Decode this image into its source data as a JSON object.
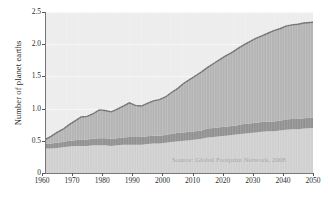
{
  "chart_data": {
    "type": "area",
    "title": "",
    "subtitle": "",
    "xlabel": "",
    "ylabel": "Number of planet earths",
    "xlim": [
      1961,
      2050
    ],
    "ylim": [
      0,
      2.5
    ],
    "grid": true,
    "legend_position": "none",
    "annotations": [
      "Source: Global Footprint Network, 2008"
    ],
    "xticks": [
      "1960",
      "1970",
      "1980",
      "1990",
      "2000",
      "2010",
      "2020",
      "2030",
      "2040",
      "2050"
    ],
    "yticks": [
      "0",
      "0.5",
      "1.0",
      "1.5",
      "2.0",
      "2.5"
    ],
    "stacked": true,
    "x": [
      1961,
      1963,
      1965,
      1967,
      1969,
      1971,
      1973,
      1975,
      1977,
      1979,
      1981,
      1983,
      1985,
      1987,
      1989,
      1991,
      1993,
      1995,
      1997,
      1999,
      2001,
      2003,
      2005,
      2007,
      2009,
      2011,
      2013,
      2015,
      2017,
      2019,
      2021,
      2023,
      2025,
      2027,
      2029,
      2031,
      2033,
      2035,
      2037,
      2039,
      2041,
      2043,
      2045,
      2047,
      2050
    ],
    "series": [
      {
        "name": "Band 1 (bottom, light grey)",
        "color": "#cfcfcf",
        "values": [
          0.38,
          0.38,
          0.39,
          0.4,
          0.41,
          0.42,
          0.42,
          0.42,
          0.43,
          0.43,
          0.43,
          0.42,
          0.43,
          0.44,
          0.44,
          0.44,
          0.44,
          0.45,
          0.46,
          0.46,
          0.47,
          0.48,
          0.49,
          0.5,
          0.51,
          0.52,
          0.53,
          0.55,
          0.56,
          0.57,
          0.58,
          0.59,
          0.6,
          0.61,
          0.62,
          0.63,
          0.64,
          0.65,
          0.65,
          0.66,
          0.67,
          0.68,
          0.68,
          0.69,
          0.7
        ]
      },
      {
        "name": "Band 2 (middle, dark grey)",
        "color": "#8f8f8f",
        "values": [
          0.07,
          0.08,
          0.08,
          0.08,
          0.09,
          0.09,
          0.1,
          0.1,
          0.1,
          0.11,
          0.11,
          0.11,
          0.11,
          0.11,
          0.12,
          0.12,
          0.12,
          0.12,
          0.12,
          0.12,
          0.12,
          0.13,
          0.13,
          0.13,
          0.13,
          0.13,
          0.13,
          0.14,
          0.14,
          0.14,
          0.14,
          0.14,
          0.14,
          0.15,
          0.15,
          0.15,
          0.15,
          0.15,
          0.15,
          0.15,
          0.16,
          0.16,
          0.16,
          0.16,
          0.16
        ]
      },
      {
        "name": "Band 3 (top, medium grey)",
        "color": "#b3b3b3",
        "values": [
          0.07,
          0.11,
          0.16,
          0.2,
          0.25,
          0.3,
          0.35,
          0.36,
          0.39,
          0.44,
          0.43,
          0.42,
          0.45,
          0.49,
          0.53,
          0.49,
          0.48,
          0.51,
          0.54,
          0.56,
          0.59,
          0.64,
          0.69,
          0.76,
          0.81,
          0.86,
          0.91,
          0.95,
          1.0,
          1.05,
          1.1,
          1.14,
          1.19,
          1.23,
          1.27,
          1.31,
          1.34,
          1.37,
          1.41,
          1.43,
          1.45,
          1.46,
          1.47,
          1.48,
          1.48
        ]
      }
    ],
    "total": [
      0.52,
      0.57,
      0.63,
      0.68,
      0.75,
      0.81,
      0.87,
      0.88,
      0.92,
      0.98,
      0.97,
      0.95,
      0.99,
      1.04,
      1.09,
      1.05,
      1.04,
      1.08,
      1.12,
      1.14,
      1.18,
      1.25,
      1.31,
      1.39,
      1.45,
      1.51,
      1.57,
      1.64,
      1.7,
      1.76,
      1.82,
      1.87,
      1.93,
      1.99,
      2.04,
      2.09,
      2.13,
      2.17,
      2.21,
      2.24,
      2.28,
      2.3,
      2.31,
      2.33,
      2.34
    ]
  },
  "axes": {
    "ylabel": "Number of planet earths",
    "yticks": [
      {
        "label": "2.5",
        "value": 2.5
      },
      {
        "label": "2.0",
        "value": 2.0
      },
      {
        "label": "1.5",
        "value": 1.5
      },
      {
        "label": "1.0",
        "value": 1.0
      },
      {
        "label": "0.5",
        "value": 0.5
      },
      {
        "label": "0",
        "value": 0
      }
    ],
    "xticks": [
      {
        "label": "1960",
        "value": 1960
      },
      {
        "label": "1970",
        "value": 1970
      },
      {
        "label": "1980",
        "value": 1980
      },
      {
        "label": "1990",
        "value": 1990
      },
      {
        "label": "2000",
        "value": 2000
      },
      {
        "label": "2010",
        "value": 2010
      },
      {
        "label": "2020",
        "value": 2020
      },
      {
        "label": "2030",
        "value": 2030
      },
      {
        "label": "2040",
        "value": 2040
      },
      {
        "label": "2050",
        "value": 2050
      }
    ]
  },
  "source": {
    "text": "Source: Global Footprint Network, 2008"
  },
  "colors": {
    "plot_background": "#ececec",
    "band_bottom": "#cfcfcf",
    "band_middle": "#8f8f8f",
    "band_top": "#b3b3b3",
    "top_line": "#6e6e6e",
    "axis": "#777777",
    "text": "#2b2b2b",
    "source_text": "#a8a8a8"
  }
}
